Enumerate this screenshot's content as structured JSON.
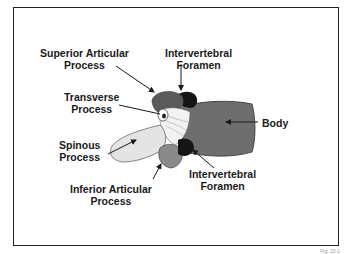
{
  "diagram": {
    "labels": {
      "superior_articular": [
        "Superior Articular",
        "Process"
      ],
      "intervertebral_top": [
        "Intervertebral",
        "Foramen"
      ],
      "transverse": [
        "Transverse",
        "Process"
      ],
      "body": [
        "Body"
      ],
      "spinous": [
        "Spinous",
        "Process"
      ],
      "intervertebral_bottom": [
        "Intervertebral",
        "Foramen"
      ],
      "inferior_articular": [
        "Inferior Articular",
        "Process"
      ]
    },
    "caption": "Fig. 15-1",
    "colors": {
      "frame": "#222222",
      "body": "#6e6e6e",
      "spinous": "#e4e4e4",
      "articular": "#5a5a5a",
      "foramen": "#151515"
    }
  }
}
